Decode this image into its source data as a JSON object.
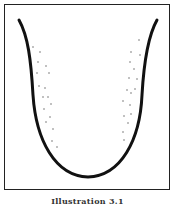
{
  "figure": {
    "caption": "Illustration 3.1",
    "stroke_color": "#111111",
    "dot_color": "#555555",
    "curve_path": "M19,20 C28,36 31,60 33,95 C36,140 55,176 88,177 C121,176 140,140 142,95 C144,60 148,36 157,20",
    "dots_left": [
      [
        33,
        47
      ],
      [
        40,
        52
      ],
      [
        38,
        62
      ],
      [
        46,
        66
      ],
      [
        37,
        73
      ],
      [
        49,
        73
      ],
      [
        39,
        86
      ],
      [
        45,
        88
      ],
      [
        43,
        97
      ],
      [
        48,
        97
      ],
      [
        51,
        104
      ],
      [
        44,
        109
      ],
      [
        50,
        117
      ],
      [
        46,
        122
      ],
      [
        53,
        129
      ],
      [
        52,
        141
      ],
      [
        57,
        147
      ]
    ],
    "dots_right": [
      [
        139,
        40
      ],
      [
        131,
        52
      ],
      [
        140,
        55
      ],
      [
        130,
        62
      ],
      [
        134,
        69
      ],
      [
        129,
        78
      ],
      [
        137,
        79
      ],
      [
        127,
        90
      ],
      [
        135,
        89
      ],
      [
        131,
        93
      ],
      [
        123,
        101
      ],
      [
        130,
        105
      ],
      [
        124,
        116
      ],
      [
        131,
        114
      ],
      [
        128,
        123
      ],
      [
        123,
        132
      ],
      [
        124,
        140
      ]
    ]
  }
}
